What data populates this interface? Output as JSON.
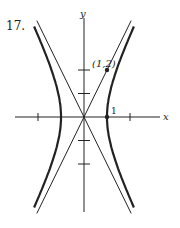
{
  "problem_number": "17.",
  "axes": {
    "x_label": "x",
    "y_label": "y"
  },
  "point_label": "(1,2)",
  "vertex_label": "1",
  "hyperbola": {
    "a": 1,
    "b": 2,
    "equation": "x^2 - y^2/4 = 1",
    "vertices": [
      [
        1,
        0
      ],
      [
        -1,
        0
      ]
    ],
    "asymptote_slopes": [
      2,
      -2
    ]
  },
  "ticks": {
    "x": [
      -2,
      2
    ],
    "y": [
      -2,
      -1,
      1,
      2
    ]
  },
  "marked_points": [
    [
      1,
      2
    ],
    [
      1,
      0
    ]
  ],
  "colors": {
    "ink": "#222222"
  }
}
